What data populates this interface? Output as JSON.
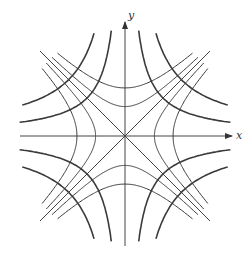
{
  "figure": {
    "x_label": "x",
    "y_label": "y",
    "origin_px": [
      125,
      136
    ],
    "colors": {
      "curve": "#3a3a3a",
      "axis": "#444444",
      "background": "#ffffff"
    },
    "families": [
      {
        "name": "xy = c",
        "style": "thick",
        "levels": [
          1,
          2.2
        ]
      },
      {
        "name": "x^2 - y^2 = c",
        "style": "thin",
        "levels": [
          0.6,
          1.6
        ]
      }
    ]
  }
}
